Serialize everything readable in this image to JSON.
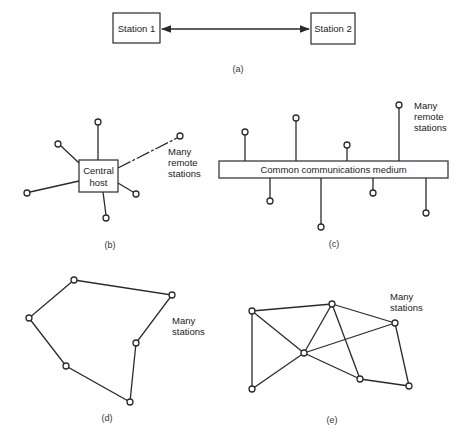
{
  "colors": {
    "line": "#2a2a2a",
    "text": "#222222",
    "background": "#ffffff"
  },
  "panel_a": {
    "caption": "(a)",
    "station1": "Station 1",
    "station2": "Station 2",
    "link": "bidirectional-arrow"
  },
  "panel_b": {
    "caption": "(b)",
    "host_line1": "Central",
    "host_line2": "host",
    "label_line1": "Many",
    "label_line2": "remote",
    "label_line3": "stations"
  },
  "panel_c": {
    "caption": "(c)",
    "medium": "Common communications medium",
    "label_line1": "Many",
    "label_line2": "remote",
    "label_line3": "stations"
  },
  "panel_d": {
    "caption": "(d)",
    "label_line1": "Many",
    "label_line2": "stations"
  },
  "panel_e": {
    "caption": "(e)",
    "label_line1": "Many",
    "label_line2": "stations"
  }
}
